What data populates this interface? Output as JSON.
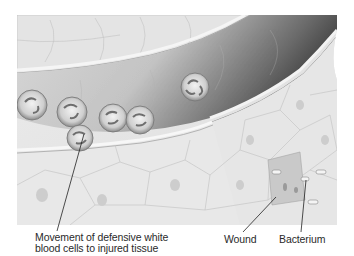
{
  "figure": {
    "labels": {
      "movement": [
        "Movement of defensive white",
        "blood cells to injured tissue"
      ],
      "wound": "Wound",
      "bacterium": "Bacterium"
    },
    "colors": {
      "background": "#ffffff",
      "tissue": "#e6e6e6",
      "vessel_dark": "#555555",
      "text": "#2a2a2a",
      "leader_line": "#222222"
    }
  }
}
